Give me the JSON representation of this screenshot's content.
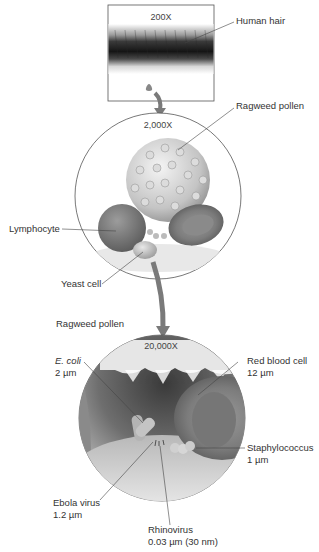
{
  "panels": [
    {
      "id": "hair",
      "magnification": "200X"
    },
    {
      "id": "cells",
      "magnification": "2,000X"
    },
    {
      "id": "microbes",
      "magnification": "20,000X"
    }
  ],
  "labels": {
    "human_hair": "Human hair",
    "ragweed_pollen_1": "Ragweed pollen",
    "lymphocyte": "Lymphocyte",
    "yeast_cell": "Yeast cell",
    "ragweed_pollen_2": "Ragweed pollen",
    "ecoli_name": "E. coli",
    "ecoli_size": "2 µm",
    "rbc_name": "Red blood cell",
    "rbc_size": "12 µm",
    "staph_name": "Staphylococcus",
    "staph_size": "1 µm",
    "ebola_name": "Ebola virus",
    "ebola_size": "1.2 µm",
    "rhino_name": "Rhinovirus",
    "rhino_size": "0.03 µm (30 nm)"
  },
  "colors": {
    "outline": "#555555",
    "arrow": "#777777",
    "hair_dark": "#1e1e1e",
    "rbc": "#8a8a8a",
    "pollen": "#c8c8c8"
  }
}
